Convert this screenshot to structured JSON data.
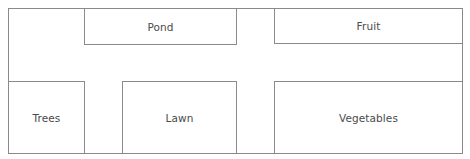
{
  "diagram": {
    "type": "garden-layout-plan",
    "plots": [
      {
        "id": "pond",
        "label": "Pond"
      },
      {
        "id": "fruit",
        "label": "Fruit"
      },
      {
        "id": "trees",
        "label": "Trees"
      },
      {
        "id": "lawn",
        "label": "Lawn"
      },
      {
        "id": "vegetables",
        "label": "Vegetables"
      }
    ]
  },
  "colors": {
    "border": "#8a8a8a",
    "text": "#4a4a4a",
    "background": "#ffffff"
  }
}
